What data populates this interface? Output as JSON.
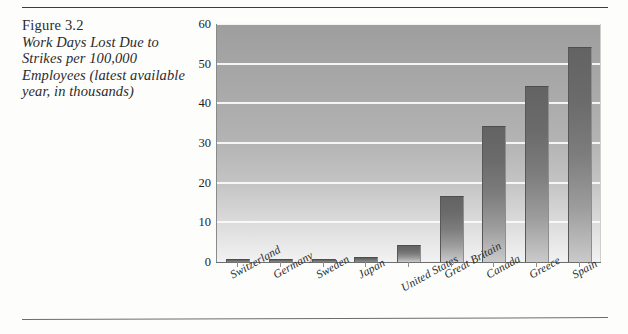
{
  "figure": {
    "number": "Figure 3.2",
    "title": "Work Days Lost Due to Strikes per 100,000 Employees (latest available year, in thousands)"
  },
  "chart_data": {
    "type": "bar",
    "title": "Work Days Lost Due to Strikes per 100,000 Employees (latest available year, in thousands)",
    "xlabel": "",
    "ylabel": "",
    "ylim": [
      0,
      60
    ],
    "yticks": [
      0,
      10,
      20,
      30,
      40,
      50,
      60
    ],
    "grid": true,
    "legend": false,
    "categories": [
      "Switzerland",
      "Germany",
      "Sweden",
      "Japan",
      "United States",
      "Great Britain",
      "Canada",
      "Greece",
      "Spain"
    ],
    "values": [
      0.2,
      0.3,
      0.6,
      1.0,
      4.0,
      16.5,
      34.0,
      44.0,
      54.0
    ]
  }
}
